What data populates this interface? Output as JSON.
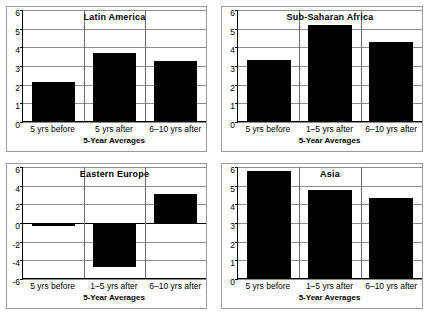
{
  "chart_data": [
    {
      "type": "bar",
      "title": "Latin America",
      "xlabel": "5-Year Averages",
      "ylabel": "",
      "categories": [
        "5 yrs before",
        "5 yrs after",
        "6–10 yrs after"
      ],
      "values": [
        2.15,
        3.7,
        3.25
      ],
      "yticks": [
        0,
        1,
        2,
        3,
        4,
        5,
        6
      ],
      "ylim": [
        0,
        6
      ],
      "grid": true,
      "legend": "none",
      "bar_color": "#000000"
    },
    {
      "type": "bar",
      "title": "Sub-Saharan Africa",
      "xlabel": "5-Year Averages",
      "ylabel": "",
      "categories": [
        "5 yrs before",
        "1–5 yrs after",
        "6–10 yrs after"
      ],
      "values": [
        3.3,
        5.2,
        4.3
      ],
      "yticks": [
        0,
        1,
        2,
        3,
        4,
        5,
        6
      ],
      "ylim": [
        0,
        6
      ],
      "grid": true,
      "legend": "none",
      "bar_color": "#000000"
    },
    {
      "type": "bar",
      "title": "Eastern Europe",
      "xlabel": "5-Year Averages",
      "ylabel": "",
      "categories": [
        "5 yrs before",
        "1–5 yrs after",
        "6–10 yrs after"
      ],
      "values": [
        -0.2,
        -4.7,
        3.1
      ],
      "yticks": [
        6,
        4,
        2,
        0,
        -2,
        -4,
        -6
      ],
      "ylim": [
        -6,
        6
      ],
      "grid": true,
      "legend": "none",
      "bar_color": "#000000"
    },
    {
      "type": "bar",
      "title": "Asia",
      "xlabel": "5-Year Averages",
      "ylabel": "",
      "categories": [
        "5 yrs before",
        "1–5 yrs after",
        "6–10 yrs after"
      ],
      "values": [
        5.8,
        4.75,
        4.35
      ],
      "yticks": [
        0,
        1,
        2,
        3,
        4,
        5,
        6
      ],
      "ylim": [
        0,
        6
      ],
      "grid": true,
      "legend": "none",
      "bar_color": "#000000"
    }
  ]
}
